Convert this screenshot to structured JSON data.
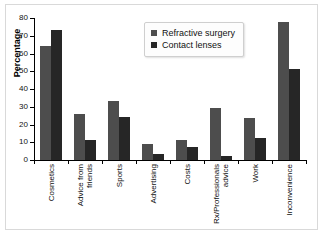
{
  "chart_data": {
    "type": "bar",
    "title": "",
    "xlabel": "",
    "ylabel": "Percentage",
    "ylim": [
      0,
      80
    ],
    "yticks": [
      0,
      10,
      20,
      30,
      40,
      50,
      60,
      70,
      80
    ],
    "grid": false,
    "legend_position": "top-center",
    "categories": [
      "Cosmetics",
      "Advice from friends",
      "Sports",
      "Advertising",
      "Costs",
      "Rx/Professionals advice",
      "Work",
      "Inconvenience"
    ],
    "category_lines": [
      [
        "Cosmetics"
      ],
      [
        "Advice from",
        "friends"
      ],
      [
        "Sports"
      ],
      [
        "Advertising"
      ],
      [
        "Costs"
      ],
      [
        "Rx/Professionals",
        "advice"
      ],
      [
        "Work"
      ],
      [
        "Inconvenience"
      ]
    ],
    "series": [
      {
        "name": "Refractive surgery",
        "color": "#4d4d4d",
        "values": [
          64,
          26,
          33,
          9,
          11.5,
          29.5,
          23.5,
          78
        ]
      },
      {
        "name": "Contact lenses",
        "color": "#262626",
        "values": [
          73,
          11.5,
          24.5,
          3.5,
          7.5,
          2,
          12.5,
          51
        ]
      }
    ]
  },
  "legend": {
    "items": [
      {
        "label": "Refractive surgery"
      },
      {
        "label": "Contact lenses"
      }
    ]
  }
}
